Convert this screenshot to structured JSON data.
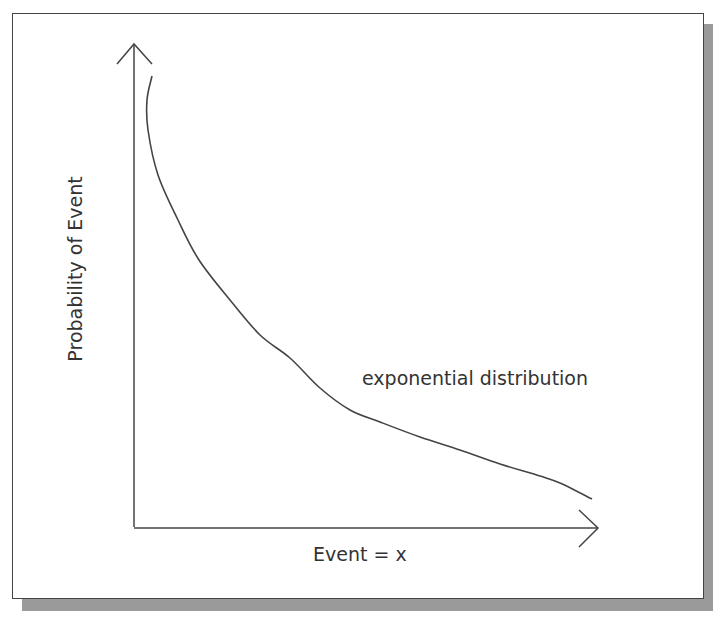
{
  "diagram": {
    "type": "conceptual-curve",
    "y_axis_label": "Probability of Event",
    "x_axis_label": "Event = x",
    "curve_label": "exponential distribution",
    "colors": {
      "line": "#444444",
      "text": "#333333",
      "shadow": "#9a9a9a",
      "border": "#444444"
    },
    "curve_points": [
      [
        152,
        76
      ],
      [
        147,
        100
      ],
      [
        148,
        130
      ],
      [
        158,
        175
      ],
      [
        178,
        220
      ],
      [
        199,
        260
      ],
      [
        230,
        300
      ],
      [
        260,
        335
      ],
      [
        290,
        358
      ],
      [
        320,
        388
      ],
      [
        350,
        410
      ],
      [
        380,
        422
      ],
      [
        420,
        437
      ],
      [
        460,
        450
      ],
      [
        500,
        464
      ],
      [
        540,
        476
      ],
      [
        560,
        483
      ],
      [
        592,
        499
      ]
    ]
  }
}
